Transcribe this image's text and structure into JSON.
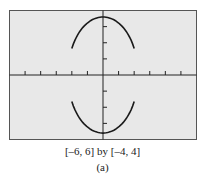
{
  "caption": {
    "window": "[–6, 6] by [–4, 4]",
    "label": "(a)"
  },
  "colors": {
    "screen": "#e8e8e8",
    "frame": "#555555",
    "curve": "#1a1a1a"
  },
  "chart_data": {
    "type": "line",
    "title": "",
    "xlabel": "",
    "ylabel": "",
    "xlim": [
      -6,
      6
    ],
    "ylim": [
      -4,
      4
    ],
    "xscale_ticks": 1,
    "yscale_ticks": 1,
    "grid": false,
    "legend": "none",
    "series": [
      {
        "name": "upper arc",
        "x": [
          -2,
          -1.5,
          -1,
          -0.5,
          0,
          0.5,
          1,
          1.5,
          2
        ],
        "y": [
          1.4,
          2.6,
          3.2,
          3.5,
          3.6,
          3.5,
          3.2,
          2.6,
          1.4
        ]
      },
      {
        "name": "lower arc",
        "x": [
          -2,
          -1.5,
          -1,
          -0.5,
          0,
          0.5,
          1,
          1.5,
          2
        ],
        "y": [
          -1.4,
          -2.6,
          -3.2,
          -3.5,
          -3.6,
          -3.5,
          -3.2,
          -2.6,
          -1.4
        ]
      }
    ]
  }
}
